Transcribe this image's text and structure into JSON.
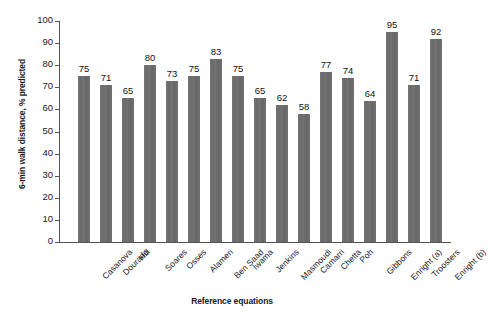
{
  "chart_data": {
    "type": "bar",
    "title": "",
    "xlabel": "Reference equations",
    "ylabel": "6-min walk distance, % predicted",
    "ylim": [
      0,
      100
    ],
    "ytick_step": 10,
    "yticks": [
      0,
      10,
      20,
      30,
      40,
      50,
      60,
      70,
      80,
      90,
      100
    ],
    "grid": false,
    "legend": false,
    "bar_color": "#6e6e6e",
    "categories": [
      "Casanova",
      "Dourado",
      "Hill",
      "Soares",
      "Osses",
      "Alameri",
      "Ben Saad",
      "Iwama",
      "Jenkins",
      "Masmoudi",
      "Camarri",
      "Chetta",
      "Poh",
      "Gibbons",
      "Enright (a)",
      "Troosters",
      "Enright (b)"
    ],
    "values": [
      75,
      71,
      65,
      80,
      73,
      75,
      83,
      75,
      65,
      62,
      58,
      77,
      74,
      64,
      95,
      71,
      92
    ],
    "data_labels": [
      "75",
      "71",
      "65",
      "80",
      "73",
      "75",
      "83",
      "75",
      "65",
      "62",
      "58",
      "77",
      "74",
      "64",
      "95",
      "71",
      "92"
    ]
  }
}
